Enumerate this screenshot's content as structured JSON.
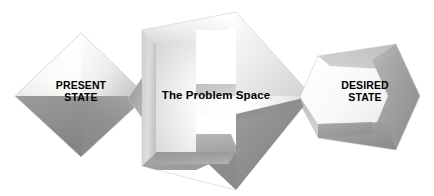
{
  "canvas": {
    "width": 434,
    "height": 196,
    "background_color": "#ffffff"
  },
  "diagram": {
    "type": "process-flow",
    "title_text_visible": false,
    "shapes": [
      {
        "id": "present-state",
        "icon_name": "diamond-shape",
        "label": "PRESENT\nSTATE",
        "geometry": "diamond",
        "fill_light": "#fdfdfd",
        "fill_mid": "#d8d8d8",
        "fill_dark": "#8e8e8e",
        "bounds": {
          "x": 15,
          "y": 33,
          "width": 132,
          "height": 124
        }
      },
      {
        "id": "problem-space",
        "icon_name": "chevron-arrow-shape",
        "label": "The Problem Space",
        "geometry": "right-arrow-chevron-3d",
        "fill_light": "#ffffff",
        "fill_mid": "#dcdcdc",
        "fill_dark": "#8b8b8b",
        "bounds": {
          "x": 140,
          "y": 12,
          "width": 172,
          "height": 178
        }
      },
      {
        "id": "desired-state",
        "icon_name": "chevron-shape",
        "label": "DESIRED\nSTATE",
        "geometry": "right-chevron-hex",
        "fill_light": "#fbfbfb",
        "fill_mid": "#d2d2d2",
        "fill_dark": "#9a9a9a",
        "bounds": {
          "x": 300,
          "y": 44,
          "width": 120,
          "height": 106
        }
      }
    ],
    "text_color": "#000000"
  }
}
